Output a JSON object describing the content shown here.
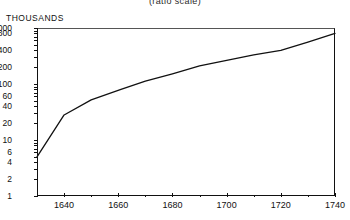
{
  "subtitle": "(ratio  scale)",
  "units_label": "THOUSANDS",
  "chart_data": {
    "type": "line",
    "title": "",
    "subtitle": "(ratio  scale)",
    "xlabel": "",
    "ylabel": "THOUSANDS",
    "yscale": "log",
    "ylim": [
      1,
      1000
    ],
    "xlim": [
      1630,
      1740
    ],
    "grid": false,
    "legend": null,
    "ytick_labels": [
      "1,000",
      "800",
      "400",
      "200",
      "100",
      "60",
      "40",
      "20",
      "10",
      "6",
      "4",
      "2",
      "1"
    ],
    "ytick_values": [
      1000,
      800,
      400,
      200,
      100,
      60,
      40,
      20,
      10,
      6,
      4,
      2,
      1
    ],
    "xtick_labels": [
      "1640",
      "1660",
      "1680",
      "1700",
      "1720",
      "1740"
    ],
    "xtick_values": [
      1640,
      1660,
      1680,
      1700,
      1720,
      1740
    ],
    "xtick_minor": [
      1630,
      1650,
      1670,
      1690,
      1710,
      1730
    ],
    "series": [
      {
        "name": "population",
        "x": [
          1630,
          1640,
          1650,
          1661,
          1670,
          1680,
          1690,
          1700,
          1710,
          1720,
          1730,
          1740
        ],
        "values": [
          5,
          28,
          52,
          80,
          112,
          152,
          210,
          265,
          332,
          400,
          560,
          800
        ]
      }
    ]
  }
}
